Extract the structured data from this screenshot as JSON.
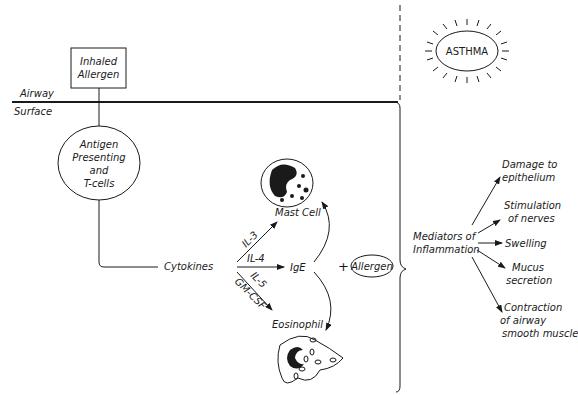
{
  "airway": {
    "top_label": "Airway",
    "bottom_label": "Surface"
  },
  "inhaled_allergen": {
    "line1": "Inhaled",
    "line2": "Allergen"
  },
  "apc": {
    "line1": "Antigen",
    "line2": "Presenting",
    "line3": "and",
    "line4": "T-cells"
  },
  "cytokines": "Cytokines",
  "pathways": {
    "il3": "IL-3",
    "il4": "IL-4",
    "il5": "IL-5",
    "gmcsf": "GM-CSF"
  },
  "mast_cell": "Mast Cell",
  "ige": "IgE",
  "plus": "+",
  "allergen": "Allergen",
  "eosinophil": "Eosinophil",
  "asthma": "ASTHMA",
  "mediators": {
    "line1": "Mediators of",
    "line2": "Inflammation"
  },
  "effects": [
    {
      "line1": "Damage to",
      "line2": "epithelium"
    },
    {
      "line1": "Stimulation",
      "line2": "of nerves"
    },
    {
      "line1": "Swelling"
    },
    {
      "line1": "Mucus",
      "line2": "secretion"
    },
    {
      "line1": "Contraction",
      "line2": "of airway",
      "line3": "smooth muscle"
    }
  ]
}
